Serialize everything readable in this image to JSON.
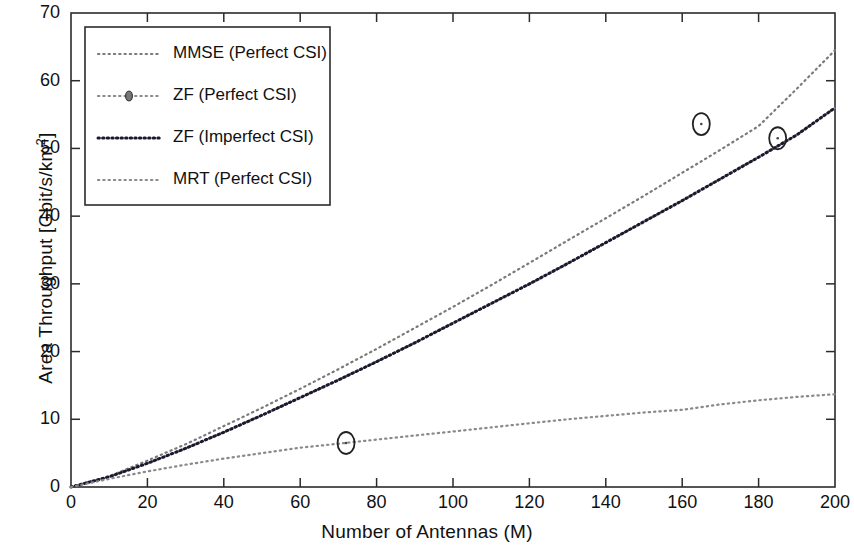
{
  "chart_data": {
    "type": "line",
    "title": "",
    "xlabel": "Number of Antennas (M)",
    "ylabel": "Area Throughput [Gbit/s/km2]",
    "ylabel_base": "Area Throughput [Gbit/s/km",
    "ylabel_exponent": "2",
    "ylabel_suffix": "]",
    "xlim": [
      0,
      200
    ],
    "ylim": [
      0,
      70
    ],
    "xticks": [
      0,
      20,
      40,
      60,
      80,
      100,
      120,
      140,
      160,
      180,
      200
    ],
    "yticks": [
      0,
      10,
      20,
      30,
      40,
      50,
      60,
      70
    ],
    "grid": false,
    "legend_position": "upper-left-inside",
    "series": [
      {
        "name": "MMSE (Perfect CSI)",
        "linestyle": "dotted",
        "color": "#7a7a7a",
        "marker": "none",
        "x": [
          0,
          10,
          20,
          30,
          40,
          50,
          60,
          70,
          80,
          90,
          100,
          110,
          120,
          130,
          140,
          150,
          160,
          170,
          180,
          190,
          200
        ],
        "y": [
          0.0,
          1.6,
          3.9,
          6.3,
          9.0,
          11.7,
          14.5,
          17.4,
          20.4,
          23.5,
          26.6,
          29.8,
          33.1,
          36.4,
          39.7,
          43.0,
          46.4,
          49.8,
          53.3,
          58.8,
          64.5
        ]
      },
      {
        "name": "ZF (Perfect CSI)",
        "linestyle": "dotted",
        "color": "#8a8a8a",
        "marker": "circle",
        "marker_points": [
          {
            "x": 165,
            "y": 53.6
          }
        ],
        "x": [
          0,
          10,
          20,
          30,
          40,
          50,
          60,
          70,
          80,
          90,
          100,
          110,
          120,
          130,
          140,
          150,
          160,
          165,
          170,
          180,
          190,
          200
        ],
        "y": [
          0.0,
          1.5,
          3.5,
          5.7,
          8.1,
          10.6,
          13.2,
          15.8,
          18.5,
          21.3,
          24.2,
          27.1,
          30.0,
          33.0,
          36.1,
          39.2,
          42.3,
          53.6,
          45.5,
          48.7,
          52.0,
          56.0
        ]
      },
      {
        "name": "ZF (Imperfect CSI)",
        "linestyle": "dotted",
        "color": "#1a1a2e",
        "marker": "none",
        "x": [
          0,
          10,
          20,
          30,
          40,
          50,
          60,
          70,
          80,
          90,
          100,
          110,
          120,
          130,
          140,
          150,
          160,
          170,
          180,
          190,
          200
        ],
        "y": [
          0.0,
          1.5,
          3.5,
          5.7,
          8.1,
          10.6,
          13.2,
          15.8,
          18.5,
          21.3,
          24.2,
          27.1,
          30.0,
          33.0,
          36.1,
          39.2,
          42.3,
          45.5,
          48.7,
          52.0,
          56.0
        ]
      },
      {
        "name": "MRT (Perfect CSI)",
        "linestyle": "dotted",
        "color": "#8a8a8a",
        "marker": "circle",
        "marker_points": [
          {
            "x": 72,
            "y": 6.5
          }
        ],
        "x": [
          0,
          10,
          20,
          30,
          40,
          50,
          60,
          70,
          80,
          90,
          100,
          110,
          120,
          130,
          140,
          150,
          160,
          170,
          180,
          190,
          200
        ],
        "y": [
          0.0,
          1.2,
          2.3,
          3.3,
          4.2,
          5.0,
          5.8,
          6.4,
          7.0,
          7.6,
          8.2,
          8.8,
          9.4,
          10.0,
          10.5,
          11.0,
          11.4,
          12.2,
          12.8,
          13.3,
          13.7
        ]
      }
    ],
    "annotated_markers": [
      {
        "series": "ZF (Perfect CSI)",
        "x": 165,
        "y": 53.6
      },
      {
        "series": "ZF (Imperfect CSI)",
        "x": 185,
        "y": 51.5
      },
      {
        "series": "MRT (Perfect CSI)",
        "x": 72,
        "y": 6.5
      }
    ]
  },
  "legend": {
    "entries": [
      {
        "label": "MMSE (Perfect CSI)"
      },
      {
        "label": "ZF (Perfect CSI)"
      },
      {
        "label": "ZF (Imperfect CSI)"
      },
      {
        "label": "MRT (Perfect CSI)"
      }
    ]
  },
  "ytick_labels": [
    "70",
    "60",
    "50",
    "40",
    "30",
    "20",
    "10",
    "0"
  ],
  "xtick_labels": [
    "0",
    "20",
    "40",
    "60",
    "80",
    "100",
    "120",
    "140",
    "160",
    "180",
    "200"
  ]
}
